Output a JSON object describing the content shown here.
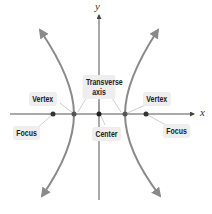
{
  "diagram": {
    "axes": {
      "x_label": "x",
      "y_label": "y"
    },
    "labels": {
      "transverse_axis_line1": "Transverse",
      "transverse_axis_line2": "axis",
      "vertex_left": "Vertex",
      "vertex_right": "Vertex",
      "focus_left": "Focus",
      "focus_right": "Focus",
      "center": "Center"
    },
    "colors": {
      "curve": "#8a8a8a",
      "axis": "#555555",
      "point": "#333333",
      "label_bg": "#eeeeee",
      "pointer_line": "#cccccc"
    }
  }
}
